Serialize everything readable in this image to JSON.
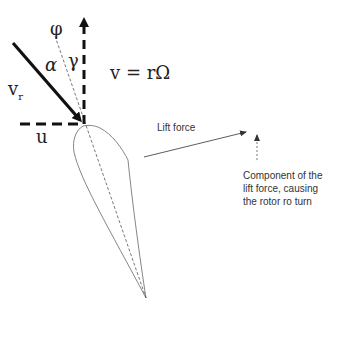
{
  "labels": {
    "phi": "φ",
    "alpha": "α",
    "gamma": "γ",
    "v_r": "v",
    "v_r_sub": "r",
    "v_eq": "v = rΩ",
    "u": "u",
    "lift_force": "Lift force",
    "component_line1": "Component of the",
    "component_line2": "lift force, causing",
    "component_line3": "the rotor ro turn"
  },
  "colors": {
    "stroke_dark": "#111111",
    "stroke_light": "#555555",
    "background": "#ffffff"
  }
}
